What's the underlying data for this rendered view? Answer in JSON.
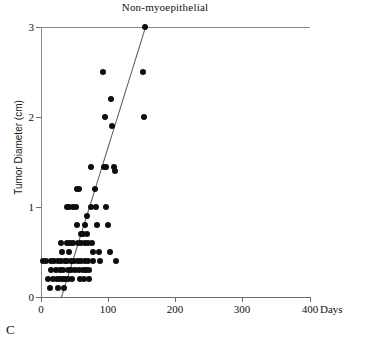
{
  "figure": {
    "panel_letter": "C",
    "title": "Non-myoepithelial"
  },
  "axes": {
    "x_axis_title": "Days",
    "y_axis_title": "Tumor Diameter (cm)",
    "x_ticks": [
      "0",
      "100",
      "200",
      "300",
      "400"
    ],
    "y_ticks": [
      "0",
      "1",
      "2",
      "3"
    ]
  },
  "chart_data": {
    "type": "scatter",
    "title": "Non-myoepithelial",
    "xlabel": "Days",
    "ylabel": "Tumor Diameter (cm)",
    "xlim": [
      0,
      400
    ],
    "ylim": [
      0,
      3
    ],
    "xticks": [
      0,
      100,
      200,
      300,
      400
    ],
    "yticks": [
      0,
      1,
      2,
      3
    ],
    "grid": false,
    "legend": "none",
    "marker": "filled-circle",
    "marker_color": "#0d0d0d",
    "points": [
      [
        3,
        0.4
      ],
      [
        8,
        0.4
      ],
      [
        10,
        0.2
      ],
      [
        13,
        0.1
      ],
      [
        15,
        0.4
      ],
      [
        15,
        0.3
      ],
      [
        18,
        0.2
      ],
      [
        20,
        0.4
      ],
      [
        22,
        0.3
      ],
      [
        24,
        0.2
      ],
      [
        25,
        0.4
      ],
      [
        26,
        0.1
      ],
      [
        28,
        0.3
      ],
      [
        28,
        0.2
      ],
      [
        30,
        0.4
      ],
      [
        30,
        0.6
      ],
      [
        31,
        0.5
      ],
      [
        32,
        0.2
      ],
      [
        33,
        0.3
      ],
      [
        34,
        0.1
      ],
      [
        35,
        0.4
      ],
      [
        36,
        0.2
      ],
      [
        38,
        0.6
      ],
      [
        38,
        1.0
      ],
      [
        39,
        0.4
      ],
      [
        40,
        0.3
      ],
      [
        40,
        0.2
      ],
      [
        41,
        0.5
      ],
      [
        42,
        1.0
      ],
      [
        43,
        0.6
      ],
      [
        44,
        0.4
      ],
      [
        45,
        0.3
      ],
      [
        46,
        0.2
      ],
      [
        47,
        1.0
      ],
      [
        48,
        0.6
      ],
      [
        49,
        0.4
      ],
      [
        50,
        0.3
      ],
      [
        52,
        1.0
      ],
      [
        53,
        1.2
      ],
      [
        54,
        0.8
      ],
      [
        55,
        0.6
      ],
      [
        55,
        0.4
      ],
      [
        56,
        1.2
      ],
      [
        57,
        0.3
      ],
      [
        58,
        0.2
      ],
      [
        59,
        0.7
      ],
      [
        60,
        0.6
      ],
      [
        60,
        0.4
      ],
      [
        62,
        0.7
      ],
      [
        63,
        0.3
      ],
      [
        64,
        0.2
      ],
      [
        65,
        0.8
      ],
      [
        66,
        0.6
      ],
      [
        66,
        0.4
      ],
      [
        67,
        0.3
      ],
      [
        68,
        0.9
      ],
      [
        69,
        0.7
      ],
      [
        70,
        0.6
      ],
      [
        70,
        0.4
      ],
      [
        71,
        0.3
      ],
      [
        72,
        0.2
      ],
      [
        74,
        1.45
      ],
      [
        75,
        1.0
      ],
      [
        76,
        0.6
      ],
      [
        77,
        0.5
      ],
      [
        78,
        0.4
      ],
      [
        80,
        1.2
      ],
      [
        82,
        1.0
      ],
      [
        84,
        0.8
      ],
      [
        86,
        0.5
      ],
      [
        88,
        0.4
      ],
      [
        92,
        2.5
      ],
      [
        94,
        1.45
      ],
      [
        95,
        2.0
      ],
      [
        96,
        1.45
      ],
      [
        97,
        1.0
      ],
      [
        100,
        0.8
      ],
      [
        102,
        0.5
      ],
      [
        104,
        2.2
      ],
      [
        106,
        1.9
      ],
      [
        108,
        1.45
      ],
      [
        110,
        1.4
      ],
      [
        112,
        0.4
      ],
      [
        152,
        2.5
      ],
      [
        153,
        2.0
      ],
      [
        155,
        3.0
      ]
    ],
    "trendline": {
      "type": "linear-fit",
      "x_start": 30,
      "y_start": 0.0,
      "x_end": 155,
      "y_end": 3.0,
      "color": "#555555"
    }
  }
}
